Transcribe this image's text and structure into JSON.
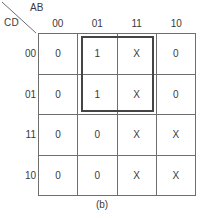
{
  "figure": {
    "caption": "(b)",
    "row_axis_label": "CD",
    "column_axis_label": "AB"
  },
  "chart_data": {
    "type": "table",
    "title": "(b)",
    "xlabel": "AB",
    "ylabel": "CD",
    "categories": [
      "00",
      "01",
      "11",
      "10"
    ],
    "row_categories": [
      "00",
      "01",
      "11",
      "10"
    ],
    "grid": true,
    "legend": "none",
    "cells": [
      [
        "0",
        "1",
        "X",
        "0"
      ],
      [
        "0",
        "1",
        "X",
        "0"
      ],
      [
        "0",
        "0",
        "X",
        "X"
      ],
      [
        "0",
        "0",
        "X",
        "X"
      ]
    ],
    "groups": [
      {
        "name": "prime-implicant-group-1",
        "start_row": 0,
        "end_row": 1,
        "start_col": 1,
        "end_col": 2,
        "color": "#454545"
      }
    ]
  },
  "colors": {
    "grid_line": "#6e6e6e",
    "text": "#3a3a3a",
    "group_outline": "#454545",
    "background": "#ffffff"
  }
}
